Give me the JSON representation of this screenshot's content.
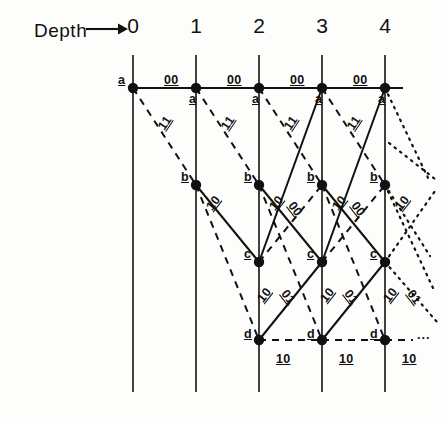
{
  "figure": {
    "axis_label": "Depth",
    "arrow_icon": "right-arrow-icon",
    "depth_ticks": [
      "0",
      "1",
      "2",
      "3",
      "4"
    ],
    "state_labels": [
      "a",
      "b",
      "c",
      "d"
    ],
    "branch_output_labels": [
      "00",
      "11",
      "10",
      "01"
    ],
    "continuation_marker": "···"
  },
  "geometry": {
    "columns_x": [
      133,
      196,
      259,
      322,
      385
    ],
    "rows_y": {
      "a": 88,
      "b": 185,
      "c": 262,
      "d": 340
    },
    "column_line_top": 55,
    "column_line_bottom": 392,
    "node_radius": 5.2
  },
  "style": {
    "ink": "#111111",
    "background": "#fdfdfb",
    "solid_stroke": 2.0,
    "dashed_stroke": 2.0,
    "dash_pattern": "7,6",
    "dot_pattern": "1.6,5.4"
  },
  "chart_data": {
    "type": "diagram",
    "subtype": "trellis",
    "xlabel": "Depth",
    "x": [
      0,
      1,
      2,
      3,
      4
    ],
    "states": [
      "a",
      "b",
      "c",
      "d"
    ],
    "legend": [
      {
        "style": "solid",
        "meaning": "input bit 0"
      },
      {
        "style": "dashed",
        "meaning": "input bit 1"
      }
    ],
    "nodes": [
      {
        "state": "a",
        "depths": [
          0,
          1,
          2,
          3,
          4
        ]
      },
      {
        "state": "b",
        "depths": [
          1,
          2,
          3,
          4
        ]
      },
      {
        "state": "c",
        "depths": [
          2,
          3,
          4
        ]
      },
      {
        "state": "d",
        "depths": [
          3,
          4
        ]
      }
    ],
    "branches": [
      {
        "from": "a",
        "to": "a",
        "output": "00",
        "line": "solid"
      },
      {
        "from": "a",
        "to": "b",
        "output": "11",
        "line": "dashed"
      },
      {
        "from": "b",
        "to": "c",
        "output": "10",
        "line": "solid"
      },
      {
        "from": "b",
        "to": "d",
        "output": "01",
        "line": "dashed"
      },
      {
        "from": "c",
        "to": "a",
        "output": "11",
        "line": "solid"
      },
      {
        "from": "c",
        "to": "b",
        "output": "00",
        "line": "dashed"
      },
      {
        "from": "d",
        "to": "c",
        "output": "01",
        "line": "solid"
      },
      {
        "from": "d",
        "to": "d",
        "output": "10",
        "line": "dashed"
      }
    ]
  },
  "labels": {
    "top_row_aa": [
      {
        "text": "00",
        "x": 164,
        "y": 73
      },
      {
        "text": "00",
        "x": 227,
        "y": 73
      },
      {
        "text": "00",
        "x": 290,
        "y": 73
      },
      {
        "text": "00",
        "x": 353,
        "y": 73
      }
    ],
    "state_a_marks": [
      {
        "text": "a",
        "x": 118,
        "y": 73
      },
      {
        "text": "a",
        "x": 189,
        "y": 92
      },
      {
        "text": "a",
        "x": 252,
        "y": 92
      },
      {
        "text": "a",
        "x": 315,
        "y": 92
      },
      {
        "text": "a",
        "x": 378,
        "y": 92
      }
    ],
    "state_b_marks": [
      {
        "text": "b",
        "x": 181,
        "y": 170
      },
      {
        "text": "b",
        "x": 244,
        "y": 170
      },
      {
        "text": "b",
        "x": 307,
        "y": 170
      },
      {
        "text": "b",
        "x": 370,
        "y": 170
      }
    ],
    "state_c_marks": [
      {
        "text": "c",
        "x": 244,
        "y": 247
      },
      {
        "text": "c",
        "x": 307,
        "y": 247
      },
      {
        "text": "c",
        "x": 370,
        "y": 247
      }
    ],
    "state_d_marks": [
      {
        "text": "d",
        "x": 244,
        "y": 327
      },
      {
        "text": "d",
        "x": 307,
        "y": 327
      },
      {
        "text": "d",
        "x": 370,
        "y": 327
      }
    ],
    "bottom_dd": [
      {
        "text": "10",
        "x": 276,
        "y": 352
      },
      {
        "text": "10",
        "x": 339,
        "y": 352
      },
      {
        "text": "10",
        "x": 402,
        "y": 352
      }
    ],
    "ab_11": [
      {
        "text": "11",
        "x": 158,
        "y": 116,
        "rot": -56
      },
      {
        "text": "11",
        "x": 221,
        "y": 116,
        "rot": -56
      },
      {
        "text": "11",
        "x": 284,
        "y": 116,
        "rot": -56
      },
      {
        "text": "11",
        "x": 347,
        "y": 116,
        "rot": -56
      }
    ],
    "bc_10": [
      {
        "text": "10",
        "x": 206,
        "y": 196,
        "rot": -52
      },
      {
        "text": "10",
        "x": 269,
        "y": 196,
        "rot": -52
      },
      {
        "text": "10",
        "x": 332,
        "y": 196,
        "rot": -52
      },
      {
        "text": "10",
        "x": 395,
        "y": 196,
        "rot": -52
      }
    ],
    "cb_00": [
      {
        "text": "00",
        "x": 288,
        "y": 202,
        "rot": 52
      },
      {
        "text": "00",
        "x": 351,
        "y": 202,
        "rot": 52
      }
    ],
    "cd_10": [
      {
        "text": "10",
        "x": 257,
        "y": 288,
        "rot": -52
      },
      {
        "text": "10",
        "x": 320,
        "y": 288,
        "rot": -52
      },
      {
        "text": "10",
        "x": 383,
        "y": 288,
        "rot": -52
      }
    ],
    "dc_01": [
      {
        "text": "01",
        "x": 281,
        "y": 290,
        "rot": 52
      },
      {
        "text": "01",
        "x": 344,
        "y": 290,
        "rot": 52
      },
      {
        "text": "01",
        "x": 407,
        "y": 290,
        "rot": 52
      }
    ]
  }
}
